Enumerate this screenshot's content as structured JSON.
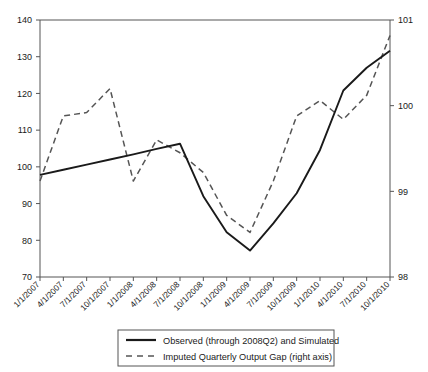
{
  "chart_data": {
    "type": "line",
    "title": "",
    "xlabel": "",
    "ylabel": "",
    "grid": false,
    "legend_position": "bottom-center",
    "categories": [
      "1/1/2007",
      "4/1/2007",
      "7/1/2007",
      "10/1/2007",
      "1/1/2008",
      "4/1/2008",
      "7/1/2008",
      "10/1/2008",
      "1/1/2009",
      "4/1/2009",
      "7/1/2009",
      "10/1/2009",
      "1/1/2010",
      "4/1/2010",
      "7/1/2010",
      "10/1/2010"
    ],
    "left_axis": {
      "label": "",
      "ylim": [
        70,
        140
      ],
      "ticks": [
        70,
        80,
        90,
        100,
        110,
        120,
        130,
        140
      ]
    },
    "right_axis": {
      "label": "right axis",
      "ylim": [
        98,
        101
      ],
      "ticks": [
        98,
        99,
        100,
        101
      ]
    },
    "series": [
      {
        "name": "Observed (through 2008Q2) and Simulated",
        "axis": "left",
        "style": "solid",
        "color": "#1a1a1a",
        "values": [
          97.8,
          99.2,
          100.6,
          102.0,
          103.4,
          104.9,
          106.3,
          92.0,
          82.2,
          77.2,
          84.6,
          92.8,
          104.6,
          120.8,
          127.0,
          131.6
        ]
      },
      {
        "name": "Imputed Quarterly Output Gap (right axis)",
        "axis": "right",
        "style": "dashed",
        "color": "#555555",
        "values": [
          99.12,
          99.88,
          99.92,
          100.2,
          99.12,
          99.6,
          99.45,
          99.22,
          98.72,
          98.52,
          99.12,
          99.88,
          100.06,
          99.84,
          100.12,
          100.82
        ]
      }
    ]
  },
  "legend": {
    "entries": [
      {
        "label": "Observed (through 2008Q2) and Simulated",
        "marker": "solid-line-swatch"
      },
      {
        "label": "Imputed Quarterly Output Gap (right axis)",
        "marker": "dashed-line-swatch"
      }
    ]
  },
  "colors": {
    "observed": "#1a1a1a",
    "gap": "#555555",
    "axis": "#555555",
    "background": "#ffffff"
  }
}
